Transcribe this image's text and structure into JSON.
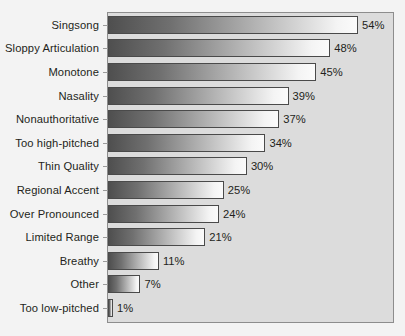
{
  "chart_data": {
    "type": "bar",
    "orientation": "horizontal",
    "title": "",
    "subtitle": "",
    "xlabel": "",
    "ylabel": "",
    "xlim": [
      0,
      62
    ],
    "grid": false,
    "legend": null,
    "value_suffix": "%",
    "categories": [
      "Singsong",
      "Sloppy Articulation",
      "Monotone",
      "Nasality",
      "Nonauthoritative",
      "Too high-pitched",
      "Thin Quality",
      "Regional Accent",
      "Over Pronounced",
      "Limited Range",
      "Breathy",
      "Other",
      "Too low-pitched"
    ],
    "values": [
      54,
      48,
      45,
      39,
      37,
      34,
      30,
      25,
      24,
      21,
      11,
      7,
      1
    ],
    "value_labels": [
      "54%",
      "48%",
      "45%",
      "39%",
      "37%",
      "34%",
      "30%",
      "25%",
      "24%",
      "21%",
      "11%",
      "7%",
      "1%"
    ],
    "colors": {
      "bar_gradient_start": "#4f4f4f",
      "bar_gradient_end": "#fbfbfb",
      "bar_border": "#4a4a4a",
      "plot_background": "#dcdcdc",
      "plot_border": "#8d8d8d",
      "page_background": "#f3f3f3",
      "text": "#231f20"
    }
  }
}
